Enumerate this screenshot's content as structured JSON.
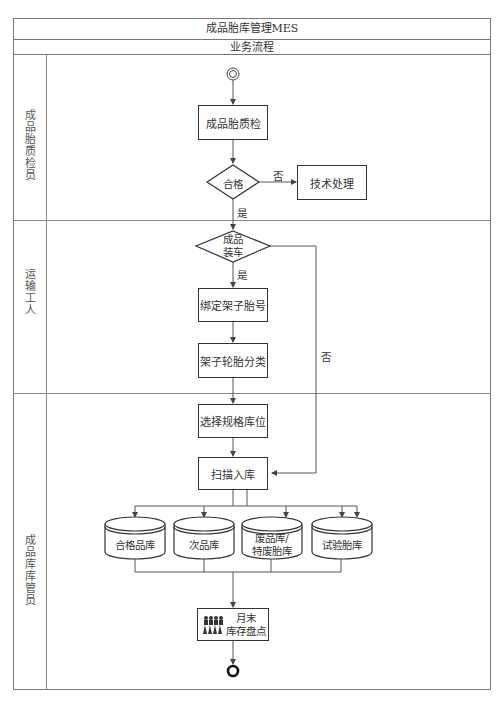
{
  "header": {
    "title": "成品胎库管理MES",
    "subtitle": "业务流程"
  },
  "lanes": [
    {
      "label": "成品胎质检员"
    },
    {
      "label": "运输工人"
    },
    {
      "label": "成品库库管员"
    }
  ],
  "nodes": {
    "start": {
      "type": "start-circle"
    },
    "inspect": {
      "label": "成品胎质检"
    },
    "qualified": {
      "label": "合格",
      "type": "decision"
    },
    "tech_process": {
      "label": "技术处理"
    },
    "loading": {
      "label_line1": "成品",
      "label_line2": "装车",
      "type": "decision"
    },
    "bind_rack": {
      "label": "绑定架子胎号"
    },
    "classify": {
      "label": "架子轮胎分类"
    },
    "select_location": {
      "label": "选择规格库位"
    },
    "scan_in": {
      "label": "扫描入库"
    },
    "stores": [
      {
        "label_line1": "合格品库",
        "label_line2": ""
      },
      {
        "label_line1": "次品库",
        "label_line2": ""
      },
      {
        "label_line1": "废品库/",
        "label_line2": "特废胎库"
      },
      {
        "label_line1": "试验胎库",
        "label_line2": ""
      }
    ],
    "inventory": {
      "label_line1": "月末",
      "label_line2": "库存盘点",
      "icon": "people-group-icon"
    },
    "end": {
      "type": "end-circle"
    }
  },
  "edges": {
    "yes": "是",
    "no": "否"
  }
}
